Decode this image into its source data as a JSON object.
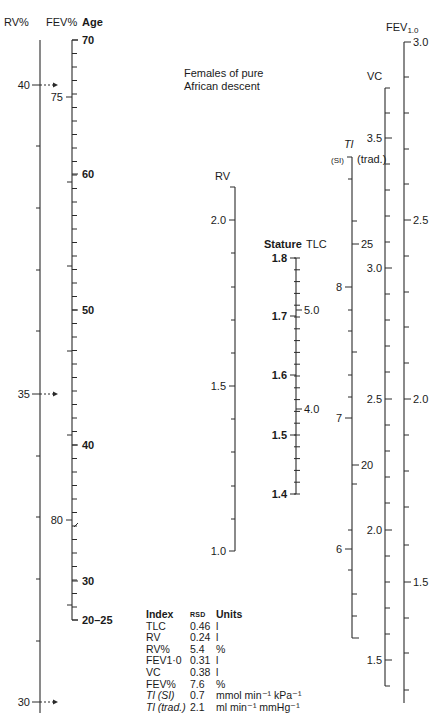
{
  "title_note": {
    "line1": "Females of pure",
    "line2": "African descent"
  },
  "headers": {
    "rv_pct": "RV%",
    "fev_pct": "FEV%",
    "age": "Age",
    "rv": "RV",
    "stature": "Stature",
    "tlc": "TLC",
    "ti": "Tl",
    "ti_si": "(SI)",
    "ti_trad": "(trad.)",
    "vc": "VC",
    "fev10": "FEV",
    "fev10_sub": "1.0"
  },
  "legend": {
    "header": {
      "index": "Index",
      "rsd": "RSD",
      "units": "Units"
    },
    "rows": [
      {
        "index": "TLC",
        "rsd": "0.46",
        "units": "l"
      },
      {
        "index": "RV",
        "rsd": "0.24",
        "units": "l"
      },
      {
        "index": "RV%",
        "rsd": "5.4",
        "units": "%"
      },
      {
        "index": "FEV1·0",
        "rsd": "0.31",
        "units": "l"
      },
      {
        "index": "VC",
        "rsd": "0.38",
        "units": "l"
      },
      {
        "index": "FEV%",
        "rsd": "7.6",
        "units": "%"
      },
      {
        "index": "Tl (SI)",
        "rsd": "0.7",
        "units": "mmol min⁻¹ kPa⁻¹"
      },
      {
        "index": "Tl (trad.)",
        "rsd": "2.1",
        "units": "ml min⁻¹ mmHg⁻¹"
      }
    ]
  },
  "chart_data": {
    "type": "nomogram",
    "title": "Females of pure African descent",
    "scales": [
      {
        "name": "RV%",
        "x": 40,
        "y_top": 40,
        "y_bottom": 713,
        "labels": [
          {
            "value": "40",
            "y": 85,
            "arrow": true
          },
          {
            "value": "35",
            "y": 394,
            "arrow": true
          },
          {
            "value": "30",
            "y": 702,
            "arrow": true
          }
        ],
        "minor_ticks": [
          146,
          208,
          270,
          331,
          456,
          517,
          579,
          641
        ],
        "tick_side": "left"
      },
      {
        "name": "FEV%",
        "x": 72,
        "side": "left",
        "labels": [
          {
            "value": "75",
            "y": 97
          },
          {
            "value": "80",
            "y": 520
          }
        ],
        "minor_ticks": [
          182,
          266,
          351,
          435,
          605
        ]
      },
      {
        "name": "Age",
        "x": 72,
        "y_top": 40,
        "y_bottom": 620,
        "labels": [
          {
            "value": "70",
            "y": 40
          },
          {
            "value": "60",
            "y": 174
          },
          {
            "value": "50",
            "y": 310
          },
          {
            "value": "40",
            "y": 445
          },
          {
            "value": "30",
            "y": 581
          },
          {
            "value": "20–25",
            "y": 620
          }
        ],
        "minor_every_px": 13.5,
        "bold": true
      },
      {
        "name": "RV",
        "x": 235,
        "y_top": 187,
        "y_bottom": 551,
        "labels": [
          {
            "value": "2.0",
            "y": 220
          },
          {
            "value": "1.5",
            "y": 386
          },
          {
            "value": "1.0",
            "y": 551
          }
        ],
        "minor_ticks": [
          253,
          287,
          320,
          353,
          419,
          452,
          486,
          519
        ]
      },
      {
        "name": "Stature",
        "x": 296,
        "y_top": 258,
        "y_bottom": 494,
        "labels": [
          {
            "value": "1.8",
            "y": 258
          },
          {
            "value": "1.7",
            "y": 316
          },
          {
            "value": "1.6",
            "y": 375
          },
          {
            "value": "1.5",
            "y": 435
          },
          {
            "value": "1.4",
            "y": 494
          }
        ],
        "minor_every_px": 11.8,
        "bold": true
      },
      {
        "name": "TLC",
        "x": 296,
        "side": "right",
        "labels": [
          {
            "value": "5.0",
            "y": 310
          },
          {
            "value": "4.0",
            "y": 409
          }
        ]
      },
      {
        "name": "Tl (SI)",
        "x": 352,
        "y_top": 157,
        "y_bottom": 638,
        "labels": [
          {
            "value": "8",
            "y": 287
          },
          {
            "value": "7",
            "y": 418
          },
          {
            "value": "6",
            "y": 549
          }
        ],
        "minor_ticks": [
          221,
          352,
          484,
          594,
          616
        ]
      },
      {
        "name": "Tl (trad.)",
        "x": 352,
        "side": "right",
        "labels": [
          {
            "value": "25",
            "y": 244
          },
          {
            "value": "20",
            "y": 465
          }
        ]
      },
      {
        "name": "VC",
        "x": 385,
        "y_top": 88,
        "y_bottom": 686,
        "labels": [
          {
            "value": "3.5",
            "y": 138
          },
          {
            "value": "3.0",
            "y": 268
          },
          {
            "value": "2.5",
            "y": 399
          },
          {
            "value": "2.0",
            "y": 530
          },
          {
            "value": "1.5",
            "y": 660
          }
        ],
        "minor_ticks": [
          113,
          164,
          190,
          216,
          242,
          294,
          320,
          346,
          372,
          425,
          451,
          477,
          503,
          556,
          582,
          608,
          634
        ]
      },
      {
        "name": "FEV1.0",
        "x": 404,
        "y_top": 42,
        "y_bottom": 703,
        "labels": [
          {
            "value": "3.0",
            "y": 42
          },
          {
            "value": "2.5",
            "y": 220
          },
          {
            "value": "2.0",
            "y": 399
          },
          {
            "value": "1.5",
            "y": 582
          }
        ],
        "minor_ticks": [
          77,
          113,
          149,
          184,
          256,
          292,
          327,
          363,
          435,
          471,
          507,
          545,
          618,
          653,
          690
        ]
      }
    ]
  }
}
